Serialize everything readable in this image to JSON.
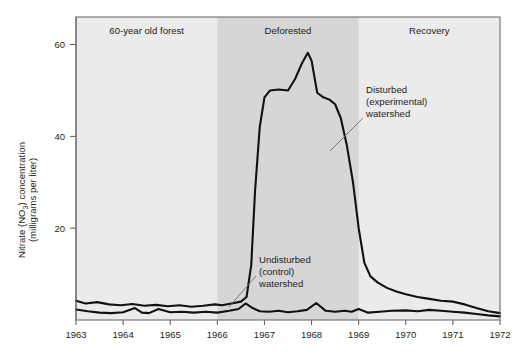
{
  "chart_data": {
    "type": "line",
    "title": "",
    "subtitle": "",
    "xlabel": "",
    "ylabel": "Nitrate (NO3) concentration (milligrams per liter)",
    "ylabel_line1": "Nitrate (NO",
    "ylabel_sub": "3",
    "ylabel_line1b": ") concentration",
    "ylabel_line2": "(milligrams per liter)",
    "xlim": [
      1963,
      1972
    ],
    "ylim": [
      0,
      66
    ],
    "grid": false,
    "legend_position": "inline-annotations",
    "x_ticks": [
      "1963",
      "1964",
      "1965",
      "1966",
      "1967",
      "1968",
      "1969",
      "1970",
      "1971",
      "1972"
    ],
    "y_ticks": [
      "20",
      "40",
      "60"
    ],
    "y_tick_values": [
      20,
      40,
      60
    ],
    "phase_bands": [
      {
        "label": "60-year old forest",
        "x_start": 1963,
        "x_end": 1966,
        "shaded": false
      },
      {
        "label": "Deforested",
        "x_start": 1966,
        "x_end": 1969,
        "shaded": true
      },
      {
        "label": "Recovery",
        "x_start": 1969,
        "x_end": 1972,
        "shaded": false
      }
    ],
    "annotations": [
      {
        "name": "disturbed",
        "lines": [
          "Disturbed",
          "(experimental)",
          "watershed"
        ]
      },
      {
        "name": "undisturbed",
        "lines": [
          "Undisturbed",
          "(control)",
          "watershed"
        ]
      }
    ],
    "series": [
      {
        "name": "Disturbed (experimental) watershed",
        "x": [
          1963.0,
          1963.2,
          1963.45,
          1963.7,
          1963.95,
          1964.2,
          1964.45,
          1964.7,
          1964.95,
          1965.2,
          1965.45,
          1965.7,
          1965.95,
          1966.1,
          1966.3,
          1966.5,
          1966.62,
          1966.72,
          1966.8,
          1966.9,
          1967.0,
          1967.12,
          1967.3,
          1967.5,
          1967.65,
          1967.8,
          1967.92,
          1968.0,
          1968.12,
          1968.25,
          1968.38,
          1968.5,
          1968.62,
          1968.75,
          1968.88,
          1969.0,
          1969.12,
          1969.25,
          1969.4,
          1969.6,
          1969.8,
          1970.0,
          1970.25,
          1970.5,
          1970.75,
          1971.0,
          1971.25,
          1971.5,
          1971.75,
          1972.0
        ],
        "y": [
          4.2,
          3.6,
          3.9,
          3.4,
          3.2,
          3.5,
          3.1,
          3.3,
          3.0,
          3.2,
          2.9,
          3.1,
          3.4,
          3.2,
          3.6,
          4.0,
          5.0,
          12.0,
          28.0,
          42.0,
          48.5,
          50.0,
          50.2,
          50.0,
          52.5,
          56.0,
          58.2,
          56.5,
          49.5,
          48.5,
          48.0,
          47.0,
          44.0,
          38.0,
          30.0,
          20.0,
          12.5,
          9.5,
          8.2,
          7.0,
          6.2,
          5.6,
          5.0,
          4.6,
          4.2,
          4.0,
          3.4,
          2.6,
          1.9,
          1.5
        ]
      },
      {
        "name": "Undisturbed (control) watershed",
        "x": [
          1963.0,
          1963.25,
          1963.5,
          1963.75,
          1964.0,
          1964.25,
          1964.4,
          1964.55,
          1964.75,
          1965.0,
          1965.25,
          1965.5,
          1965.75,
          1966.0,
          1966.25,
          1966.45,
          1966.6,
          1966.75,
          1966.9,
          1967.1,
          1967.3,
          1967.5,
          1967.7,
          1967.9,
          1968.1,
          1968.3,
          1968.5,
          1968.7,
          1968.85,
          1969.0,
          1969.2,
          1969.45,
          1969.7,
          1970.0,
          1970.25,
          1970.5,
          1970.75,
          1971.0,
          1971.25,
          1971.5,
          1971.75,
          1972.0
        ],
        "y": [
          2.3,
          1.9,
          1.6,
          1.5,
          1.7,
          2.6,
          1.6,
          1.5,
          2.4,
          1.7,
          1.8,
          1.6,
          1.8,
          1.6,
          2.0,
          2.4,
          3.6,
          2.6,
          1.9,
          1.8,
          2.0,
          1.7,
          1.9,
          2.2,
          3.7,
          2.0,
          1.8,
          2.0,
          1.8,
          2.4,
          1.6,
          1.8,
          2.0,
          2.1,
          1.9,
          2.2,
          2.0,
          1.8,
          1.6,
          1.3,
          1.0,
          0.8
        ]
      }
    ],
    "colors": {
      "background": "#ffffff",
      "plot_background": "#ebebeb",
      "band_shaded": "#d6d6d6",
      "line": "#111111",
      "axis": "#58595b",
      "text": "#231f20"
    }
  }
}
